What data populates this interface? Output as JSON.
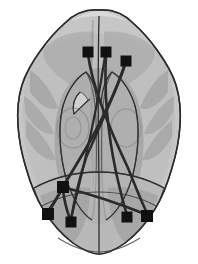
{
  "figure": {
    "title": "Brain connectivity axial glass-brain view",
    "view": "axial",
    "orientation_label": "superior view",
    "background_color": "#ffffff",
    "outline_color": "#2b2b2b",
    "node_color": "#111111",
    "edge_color": "#2a2a2a",
    "brain_fill_light": "#c9c9c9",
    "brain_fill_mid": "#b0b0b0",
    "brain_fill_dark": "#9a9a9a",
    "brain_fill_darker": "#8a8a8a",
    "caption": ""
  },
  "nodes": [
    {
      "id": "n1",
      "label": "",
      "x": 88,
      "y": 52,
      "size": 11
    },
    {
      "id": "n2",
      "label": "",
      "x": 106,
      "y": 52,
      "size": 11
    },
    {
      "id": "n3",
      "label": "",
      "x": 126,
      "y": 61,
      "size": 11
    },
    {
      "id": "n4",
      "label": "",
      "x": 63,
      "y": 187,
      "size": 12
    },
    {
      "id": "n5",
      "label": "",
      "x": 48,
      "y": 214,
      "size": 12
    },
    {
      "id": "n6",
      "label": "",
      "x": 71,
      "y": 222,
      "size": 11
    },
    {
      "id": "n7",
      "label": "",
      "x": 127,
      "y": 217,
      "size": 11
    },
    {
      "id": "n8",
      "label": "",
      "x": 147,
      "y": 216,
      "size": 12
    }
  ],
  "edges": [
    {
      "id": "e1",
      "from": "n1",
      "to": "n8",
      "width": 2.6
    },
    {
      "id": "e2",
      "from": "n2",
      "to": "n7",
      "width": 2.6
    },
    {
      "id": "e3",
      "from": "n3",
      "to": "n4",
      "width": 2.8
    },
    {
      "id": "e4",
      "from": "n3",
      "to": "n6",
      "width": 2.4
    },
    {
      "id": "e5",
      "from": "n4",
      "to": "n5",
      "width": 2.8
    },
    {
      "id": "e6",
      "from": "n4",
      "to": "n6",
      "width": 2.6
    },
    {
      "id": "e7",
      "from": "n4",
      "to": "n8",
      "width": 2.6
    },
    {
      "id": "e8",
      "from": "n2",
      "to": "n6",
      "width": 2.2
    }
  ],
  "midline": {
    "x": 99,
    "y1": 46,
    "y2": 255
  }
}
